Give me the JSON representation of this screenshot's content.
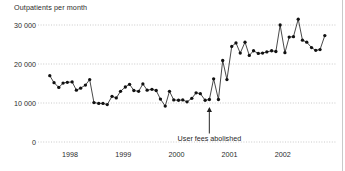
{
  "chart_data": {
    "type": "line",
    "title": "Outpatients per month",
    "xlabel": "",
    "ylabel": "",
    "ylim": [
      0,
      33000
    ],
    "xlim": [
      1997.5,
      2002.95
    ],
    "grid": true,
    "legend": null,
    "y_ticks": [
      0,
      10000,
      20000,
      30000
    ],
    "y_tick_labels": [
      "0",
      "10 000",
      "20 000",
      "30 000"
    ],
    "x_ticks": [
      1998,
      1999,
      2000,
      2001,
      2002
    ],
    "x_tick_labels": [
      "1998",
      "1999",
      "2000",
      "2001",
      "2002"
    ],
    "marker": "filled-circle",
    "line_color": "#1a1a1a",
    "marker_color": "#111111",
    "grid_color": "#bdbdbd",
    "annotations": [
      {
        "text": "User fees abolished",
        "x": 2000.62,
        "y": 0,
        "arrow": "up",
        "arrow_tip_y": 9000,
        "arrow_tail_y": 2200
      }
    ],
    "x": [
      1997.62,
      1997.7,
      1997.79,
      1997.87,
      1997.95,
      1998.04,
      1998.12,
      1998.2,
      1998.29,
      1998.37,
      1998.45,
      1998.54,
      1998.62,
      1998.7,
      1998.79,
      1998.87,
      1998.95,
      1999.04,
      1999.12,
      1999.2,
      1999.29,
      1999.37,
      1999.45,
      1999.54,
      1999.62,
      1999.7,
      1999.79,
      1999.87,
      1999.95,
      2000.04,
      2000.12,
      2000.2,
      2000.29,
      2000.37,
      2000.45,
      2000.54,
      2000.62,
      2000.7,
      2000.79,
      2000.87,
      2000.95,
      2001.04,
      2001.12,
      2001.2,
      2001.29,
      2001.37,
      2001.45,
      2001.54,
      2001.62,
      2001.7,
      2001.79,
      2001.87,
      2001.95,
      2002.04,
      2002.12,
      2002.2,
      2002.29,
      2002.37,
      2002.45,
      2002.54,
      2002.62,
      2002.7,
      2002.79
    ],
    "values": [
      17000,
      15200,
      14000,
      15100,
      15300,
      15400,
      13300,
      13800,
      14600,
      16000,
      10100,
      9900,
      9900,
      9600,
      11700,
      11300,
      13000,
      14100,
      14800,
      13200,
      13000,
      14900,
      13300,
      13500,
      13200,
      11000,
      9200,
      13000,
      10800,
      10700,
      10800,
      10300,
      11200,
      12600,
      12400,
      10700,
      10900,
      16200,
      10900,
      20900,
      16000,
      24500,
      25400,
      22800,
      25600,
      22200,
      23400,
      22700,
      22800,
      23100,
      23400,
      23200,
      30000,
      22900,
      26900,
      27000,
      31500,
      26100,
      25600,
      24200,
      23500,
      23700,
      27300
    ]
  }
}
